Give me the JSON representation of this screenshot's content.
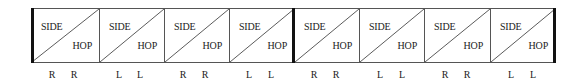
{
  "diagram": {
    "cells": [
      {
        "top_label": "SIDE",
        "bottom_label": "HOP",
        "feet": [
          "R",
          "R"
        ]
      },
      {
        "top_label": "SIDE",
        "bottom_label": "HOP",
        "feet": [
          "L",
          "L"
        ]
      },
      {
        "top_label": "SIDE",
        "bottom_label": "HOP",
        "feet": [
          "R",
          "R"
        ]
      },
      {
        "top_label": "SIDE",
        "bottom_label": "HOP",
        "feet": [
          "L",
          "L"
        ]
      },
      {
        "top_label": "SIDE",
        "bottom_label": "HOP",
        "feet": [
          "R",
          "R"
        ]
      },
      {
        "top_label": "SIDE",
        "bottom_label": "HOP",
        "feet": [
          "L",
          "L"
        ]
      },
      {
        "top_label": "SIDE",
        "bottom_label": "HOP",
        "feet": [
          "R",
          "R"
        ]
      },
      {
        "top_label": "SIDE",
        "bottom_label": "HOP",
        "feet": [
          "L",
          "L"
        ]
      }
    ],
    "bar_positions": [
      "start",
      "after-cell-4",
      "end"
    ],
    "colors": {
      "line": "#555555",
      "bar": "#111111",
      "text": "#222222",
      "background": "#ffffff"
    }
  }
}
